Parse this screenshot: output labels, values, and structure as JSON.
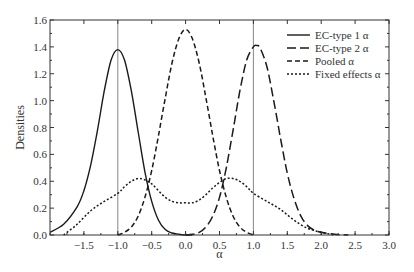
{
  "chart_data": {
    "type": "line",
    "title": "",
    "xlabel": "α",
    "ylabel": "Densities",
    "xlim": [
      -2.0,
      3.0
    ],
    "ylim": [
      0.0,
      1.6
    ],
    "xticks": [
      -1.5,
      -1.0,
      -0.5,
      0.0,
      0.5,
      1.0,
      1.5,
      2.0,
      2.5,
      3.0
    ],
    "xtick_labels": [
      "-1.5",
      "-1.0",
      "-0.5",
      "0.0",
      "0.5",
      "1.0",
      "1.5",
      "2.0",
      "2.5",
      "3.0"
    ],
    "yticks": [
      0.0,
      0.2,
      0.4,
      0.6,
      0.8,
      1.0,
      1.2,
      1.4,
      1.6
    ],
    "ytick_labels": [
      "0.0",
      "0.2",
      "0.4",
      "0.6",
      "0.8",
      "1.0",
      "1.2",
      "1.4",
      "1.6"
    ],
    "grid": false,
    "vertical_reference_lines": [
      -1.0,
      1.0
    ],
    "legend_position": "upper right",
    "series": [
      {
        "name": "EC-type 1 α",
        "style": "solid",
        "x": [
          -2.0,
          -1.8,
          -1.6,
          -1.5,
          -1.4,
          -1.3,
          -1.2,
          -1.1,
          -1.0,
          -0.9,
          -0.8,
          -0.7,
          -0.6,
          -0.5,
          -0.4,
          -0.3,
          -0.2,
          -0.1,
          0.0,
          0.1
        ],
        "y": [
          0.02,
          0.08,
          0.21,
          0.33,
          0.52,
          0.78,
          1.07,
          1.3,
          1.38,
          1.3,
          1.07,
          0.77,
          0.47,
          0.25,
          0.11,
          0.04,
          0.015,
          0.005,
          0.0,
          0.0
        ]
      },
      {
        "name": "EC-type 2 α",
        "style": "long-dash",
        "x": [
          0.0,
          0.1,
          0.2,
          0.3,
          0.4,
          0.5,
          0.6,
          0.7,
          0.8,
          0.9,
          1.0,
          1.05,
          1.1,
          1.2,
          1.3,
          1.4,
          1.5,
          1.6,
          1.7,
          1.8,
          1.9,
          2.0,
          2.2,
          2.4
        ],
        "y": [
          0.0,
          0.005,
          0.02,
          0.06,
          0.14,
          0.28,
          0.5,
          0.78,
          1.07,
          1.3,
          1.4,
          1.41,
          1.39,
          1.25,
          1.0,
          0.72,
          0.46,
          0.27,
          0.14,
          0.07,
          0.035,
          0.02,
          0.005,
          0.0
        ]
      },
      {
        "name": "Pooled α",
        "style": "dash",
        "x": [
          -1.0,
          -0.9,
          -0.8,
          -0.7,
          -0.6,
          -0.5,
          -0.4,
          -0.3,
          -0.2,
          -0.1,
          0.0,
          0.1,
          0.2,
          0.3,
          0.4,
          0.5,
          0.6,
          0.7,
          0.8,
          0.9,
          1.0
        ],
        "y": [
          0.0,
          0.02,
          0.06,
          0.14,
          0.28,
          0.48,
          0.74,
          1.02,
          1.28,
          1.46,
          1.53,
          1.46,
          1.28,
          1.02,
          0.74,
          0.48,
          0.28,
          0.14,
          0.06,
          0.02,
          0.0
        ]
      },
      {
        "name": "Fixed effects α",
        "style": "dot",
        "x": [
          -1.8,
          -1.6,
          -1.4,
          -1.2,
          -1.0,
          -0.9,
          -0.8,
          -0.7,
          -0.6,
          -0.5,
          -0.4,
          -0.3,
          -0.2,
          -0.1,
          0.0,
          0.1,
          0.2,
          0.3,
          0.4,
          0.5,
          0.6,
          0.7,
          0.8,
          0.9,
          1.0,
          1.2,
          1.4,
          1.6,
          1.8,
          2.0,
          2.2
        ],
        "y": [
          0.0,
          0.08,
          0.18,
          0.25,
          0.31,
          0.36,
          0.4,
          0.42,
          0.41,
          0.38,
          0.33,
          0.28,
          0.25,
          0.24,
          0.24,
          0.24,
          0.26,
          0.3,
          0.35,
          0.39,
          0.42,
          0.42,
          0.4,
          0.36,
          0.31,
          0.25,
          0.19,
          0.11,
          0.05,
          0.02,
          0.0
        ]
      }
    ]
  },
  "legend": {
    "items": [
      {
        "label": "EC-type 1 α",
        "dash": ""
      },
      {
        "label": "EC-type 2 α",
        "dash": "9,4"
      },
      {
        "label": "Pooled α",
        "dash": "5,3"
      },
      {
        "label": "Fixed effects α",
        "dash": "2,2"
      }
    ]
  },
  "colors": {
    "line": "#1a1a1a",
    "frame": "#333333",
    "reference_line": "#888888"
  }
}
